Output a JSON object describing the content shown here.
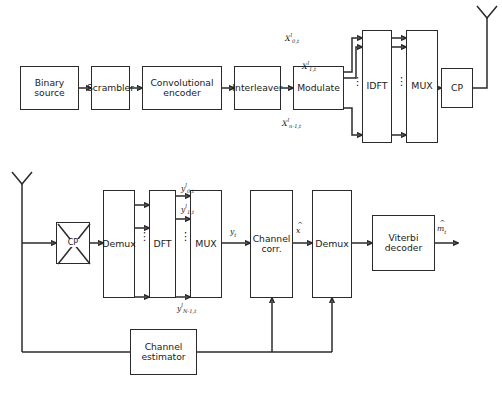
{
  "figure": {
    "type": "block-diagram",
    "line_color": "#2b2b2b",
    "background": "#ffffff"
  },
  "transmitter": {
    "name": "transmitter-chain",
    "blocks": [
      {
        "id": "binary-source",
        "label": "Binary\nsource",
        "label_line1": "Binary",
        "label_line2": "source"
      },
      {
        "id": "scrambler",
        "label": "Scrambler",
        "label_line1": "Scrambler",
        "label_line2": ""
      },
      {
        "id": "convolutional-encoder",
        "label": "Convolutional\nencoder",
        "label_line1": "Convolutional",
        "label_line2": "encoder"
      },
      {
        "id": "interleaver",
        "label": "Interleaver",
        "label_line1": "Interleaver",
        "label_line2": ""
      },
      {
        "id": "modulate",
        "label": "Modulate",
        "label_line1": "Modulate",
        "label_line2": ""
      },
      {
        "id": "idft",
        "label": "IDFT",
        "label_line1": "IDFT",
        "label_line2": ""
      },
      {
        "id": "mux",
        "label": "MUX",
        "label_line1": "MUX",
        "label_line2": ""
      },
      {
        "id": "cp",
        "label": "CP",
        "label_line1": "CP",
        "label_line2": ""
      }
    ],
    "signal_labels": [
      {
        "id": "x-0-t",
        "base": "X",
        "sup": "l",
        "sub": "0,t"
      },
      {
        "id": "x-1-t",
        "base": "X",
        "sup": "l",
        "sub": "1,t"
      },
      {
        "id": "x-n-1-t",
        "base": "X",
        "sup": "l",
        "sub": "n-1,t"
      }
    ],
    "antenna": {
      "id": "tx-antenna",
      "label": ""
    },
    "vertical_dots": "⋮"
  },
  "receiver": {
    "name": "receiver-chain",
    "blocks": [
      {
        "id": "cp-removal",
        "label": "CP",
        "label_line1": "CP",
        "label_line2": ""
      },
      {
        "id": "demux-front",
        "label": "Demux",
        "label_line1": "Demux",
        "label_line2": ""
      },
      {
        "id": "dft",
        "label": "DFT",
        "label_line1": "DFT",
        "label_line2": ""
      },
      {
        "id": "mux-rx",
        "label": "MUX",
        "label_line1": "MUX",
        "label_line2": ""
      },
      {
        "id": "channel-corr",
        "label": "Channel\ncorr.",
        "label_line1": "Channel",
        "label_line2": "corr."
      },
      {
        "id": "demux-rx",
        "label": "Demux",
        "label_line1": "Demux",
        "label_line2": ""
      },
      {
        "id": "viterbi-decoder",
        "label": "Viterbi\ndecoder",
        "label_line1": "Viterbi",
        "label_line2": "decoder"
      },
      {
        "id": "channel-estimator",
        "label": "Channel\nestimator",
        "label_line1": "Channel",
        "label_line2": "estimator"
      }
    ],
    "signal_labels": [
      {
        "id": "y-0-t",
        "base": "y",
        "sup": "l",
        "sub": "0,t"
      },
      {
        "id": "y-1-t",
        "base": "y",
        "sup": "l",
        "sub": "1,t"
      },
      {
        "id": "y-N-1-t",
        "base": "y",
        "sup": "l",
        "sub": "N-1,t"
      },
      {
        "id": "y-t",
        "base": "y",
        "sup": "",
        "sub": "t"
      },
      {
        "id": "x-hat",
        "base": "x",
        "sup": "",
        "sub": "",
        "hat": true
      },
      {
        "id": "m-hat-t",
        "base": "m",
        "sup": "",
        "sub": "t",
        "hat": true
      }
    ],
    "antenna": {
      "id": "rx-antenna",
      "label": ""
    },
    "vertical_dots": "⋮"
  }
}
